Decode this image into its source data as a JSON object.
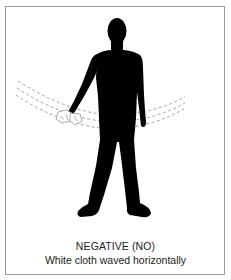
{
  "figure": {
    "title": "NEGATIVE (NO)",
    "description": "White cloth waved horizontally",
    "colors": {
      "silhouette": "#000000",
      "border": "#9a9a9a",
      "dashes": "#8a8a8a",
      "text": "#222222"
    }
  }
}
